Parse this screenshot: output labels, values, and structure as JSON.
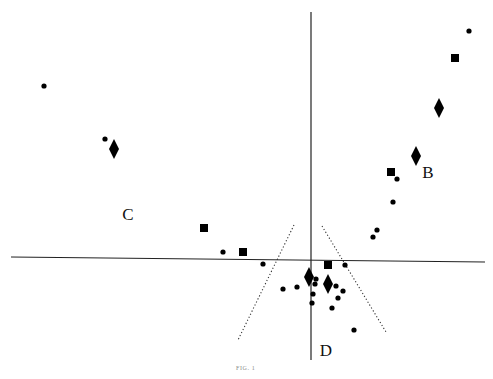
{
  "figure": {
    "caption": "FIG. 1",
    "colors": {
      "background": "#ffffff",
      "ink": "#000000",
      "caption": "#8a8a8a"
    }
  },
  "chart_data": {
    "type": "scatter",
    "title": "",
    "caption": "FIG. 1",
    "xlabel": "",
    "ylabel": "",
    "grid": false,
    "legend": null,
    "axes": {
      "horizontal": {
        "x1": 11,
        "y1": 257,
        "x2": 485,
        "y2": 262
      },
      "vertical": {
        "x1": 311,
        "y1": 12,
        "x2": 311,
        "y2": 360
      }
    },
    "region_labels": [
      {
        "text": "B",
        "x": 428,
        "y": 178
      },
      {
        "text": "C",
        "x": 128,
        "y": 220
      },
      {
        "text": "D",
        "x": 326,
        "y": 356
      }
    ],
    "dotted_lines": [
      {
        "x1": 294,
        "y1": 225,
        "x2": 238,
        "y2": 340
      },
      {
        "x1": 322,
        "y1": 226,
        "x2": 386,
        "y2": 332
      }
    ],
    "series": [
      {
        "name": "circles",
        "marker": "circle",
        "points": [
          [
            44,
            86
          ],
          [
            105,
            139
          ],
          [
            469,
            31
          ],
          [
            397,
            179
          ],
          [
            393,
            202
          ],
          [
            377,
            230
          ],
          [
            373,
            237
          ],
          [
            223,
            252
          ],
          [
            263,
            264
          ],
          [
            345,
            265
          ],
          [
            316,
            279
          ],
          [
            315,
            284
          ],
          [
            283,
            289
          ],
          [
            297,
            287
          ],
          [
            336,
            286
          ],
          [
            343,
            291
          ],
          [
            313,
            294
          ],
          [
            338,
            298
          ],
          [
            312,
            303
          ],
          [
            332,
            308
          ],
          [
            354,
            330
          ]
        ]
      },
      {
        "name": "squares",
        "marker": "square",
        "points": [
          [
            455,
            58
          ],
          [
            391,
            172
          ],
          [
            204,
            228
          ],
          [
            243,
            252
          ],
          [
            328,
            265
          ]
        ]
      },
      {
        "name": "diamonds",
        "marker": "diamond",
        "points": [
          [
            439,
            108
          ],
          [
            416,
            156
          ],
          [
            114,
            149
          ],
          [
            309,
            277
          ],
          [
            328,
            284
          ]
        ]
      }
    ]
  }
}
